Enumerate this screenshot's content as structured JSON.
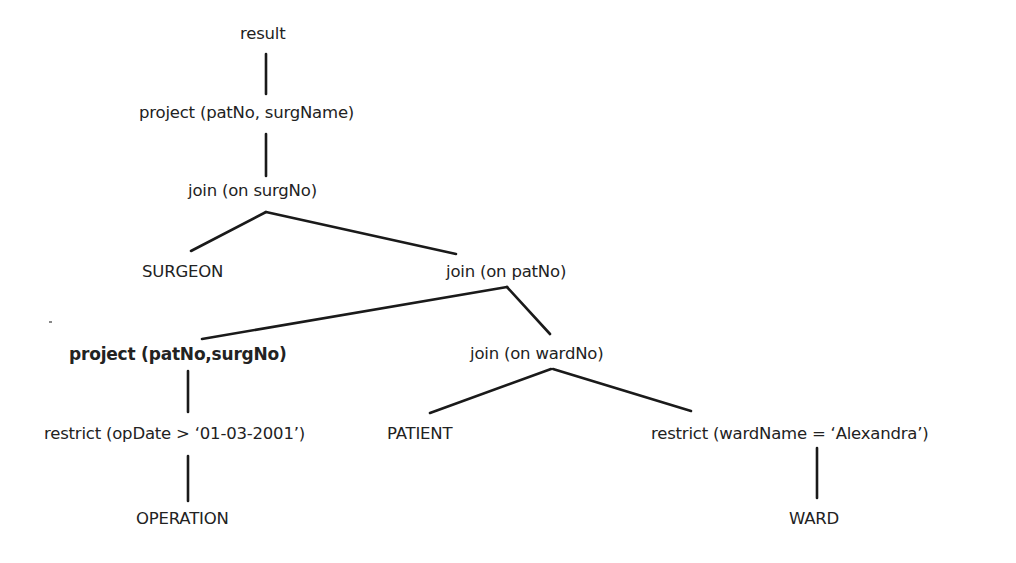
{
  "diagram": {
    "type": "query-tree",
    "nodes": {
      "result": "result",
      "project_top": "project (patNo, surgName)",
      "join_surgNo": "join (on surgNo)",
      "surgeon": "SURGEON",
      "join_patNo": "join (on patNo)",
      "project_inner": "project (patNo,surgNo)",
      "join_wardNo": "join (on wardNo)",
      "restrict_opDate": "restrict (opDate > ‘01-03-2001’)",
      "patient": "PATIENT",
      "restrict_wardName": "restrict (wardName = ‘Alexandra’)",
      "operation": "OPERATION",
      "ward": "WARD"
    },
    "edges": [
      [
        "result",
        "project_top"
      ],
      [
        "project_top",
        "join_surgNo"
      ],
      [
        "join_surgNo",
        "surgeon"
      ],
      [
        "join_surgNo",
        "join_patNo"
      ],
      [
        "join_patNo",
        "project_inner"
      ],
      [
        "join_patNo",
        "join_wardNo"
      ],
      [
        "project_inner",
        "restrict_opDate"
      ],
      [
        "restrict_opDate",
        "operation"
      ],
      [
        "join_wardNo",
        "patient"
      ],
      [
        "join_wardNo",
        "restrict_wardName"
      ],
      [
        "restrict_wardName",
        "ward"
      ]
    ],
    "highlighted_node": "project_inner"
  }
}
